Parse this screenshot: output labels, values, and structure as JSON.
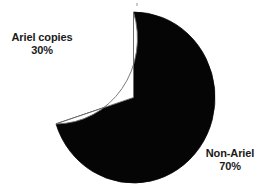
{
  "chart_data": {
    "type": "pie",
    "title": "",
    "subtitle": "",
    "xlabel": "",
    "ylabel": "",
    "grid": false,
    "legend_position": "none",
    "label_style": "outside-callout",
    "start_angle_deg": 0,
    "direction": "counterclockwise",
    "categories": [
      "Ariel copies",
      "Non-Ariel"
    ],
    "values": [
      30,
      70
    ],
    "value_suffix": "%",
    "slices": [
      {
        "label": "Ariel copies",
        "value": 30,
        "value_text": "30%",
        "color": "#ffffff",
        "stroke": "#6b6b6b",
        "label_position": "left"
      },
      {
        "label": "Non-Ariel",
        "value": 70,
        "value_text": "70%",
        "color": "#050505",
        "stroke": "#050505",
        "label_position": "bottom-right"
      }
    ],
    "annotations": []
  },
  "figure": {
    "background_color": "#ffffff",
    "outline_color": "#6b6b6b",
    "text_color": "#1a1a1a"
  },
  "labels": {
    "ariel": {
      "name": "Ariel copies",
      "value": "30%"
    },
    "non_ariel": {
      "name": "Non-Ariel",
      "value": "70%"
    }
  }
}
